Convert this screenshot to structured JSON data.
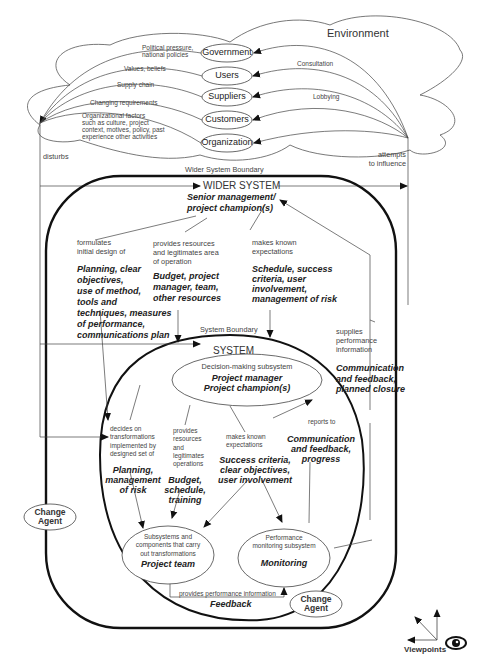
{
  "environment": {
    "title": "Environment",
    "stakeholders": [
      {
        "label": "Government",
        "influence_in": "Political pressure, national policies"
      },
      {
        "label": "Users",
        "influence_in": "Values, beliefs"
      },
      {
        "label": "Suppliers",
        "influence_in": "Supply chain"
      },
      {
        "label": "Customers",
        "influence_in": "Changing requirements"
      },
      {
        "label": "Organization",
        "influence_in": "Organizational factors such as culture, project context, motives, policy, past experience other activities"
      }
    ],
    "influence_out_labels": [
      "Consultation",
      "Lobbying"
    ],
    "political_line1": "Political pressure,",
    "political_line2": "national policies",
    "org_factors": [
      "Organizational factors",
      "such as culture, project",
      "context, motives, policy, past",
      "experience other activities"
    ],
    "disturbs": "disturbs",
    "attempts": [
      "attempts",
      "to influence"
    ]
  },
  "wider_system": {
    "boundary_label": "Wider System Boundary",
    "title": "WIDER SYSTEM",
    "subtitle": [
      "Senior management/",
      "project champion(s)"
    ],
    "formulates": [
      "formulates",
      "initial design of"
    ],
    "planning": [
      "Planning, clear",
      "objectives,",
      "use of method,",
      "tools and",
      "techniques, measures",
      "of performance,",
      "communications plan"
    ],
    "provides": [
      "provides resources",
      "and legitimates area",
      "of operation"
    ],
    "budget": [
      "Budget, project",
      "manager, team,",
      "other resources"
    ],
    "makes_known": [
      "makes known",
      "expectations"
    ],
    "schedule": [
      "Schedule, success",
      "criteria, user",
      "involvement,",
      "management of risk"
    ],
    "supplies": [
      "supplies",
      "performance",
      "information"
    ],
    "communication": [
      "Communication",
      "and feedback,",
      "planned closure"
    ]
  },
  "system": {
    "boundary_label": "System Boundary",
    "title": "SYSTEM",
    "decision": {
      "label": "Decision-making subsystem",
      "roles": [
        "Project manager",
        "Project champion(s)"
      ]
    },
    "decides": [
      "decides on",
      "transformations",
      "implemented by",
      "designed set of"
    ],
    "planning": [
      "Planning,",
      "management",
      "of risk"
    ],
    "provides": [
      "provides",
      "resources",
      "and",
      "legitimates",
      "operations"
    ],
    "budget": [
      "Budget,",
      "schedule,",
      "training"
    ],
    "makes_known": [
      "makes known",
      "expectations"
    ],
    "success": [
      "Success criteria,",
      "clear objectives,",
      "user involvement"
    ],
    "reports_to": "reports to",
    "communication": [
      "Communication",
      "and feedback,",
      "progress"
    ],
    "subsystems": {
      "label": [
        "Subsystems and",
        "components that carry",
        "out transformations"
      ],
      "role": "Project team"
    },
    "monitoring": {
      "label": [
        "Performance",
        "monitoring subsystem"
      ],
      "role": "Monitoring"
    },
    "provides_perf": "provides performance information",
    "feedback": "Feedback"
  },
  "change_agents": [
    {
      "label": [
        "Change",
        "Agent"
      ]
    },
    {
      "label": [
        "Change",
        "Agent"
      ]
    }
  ],
  "viewpoints": "Viewpoints"
}
